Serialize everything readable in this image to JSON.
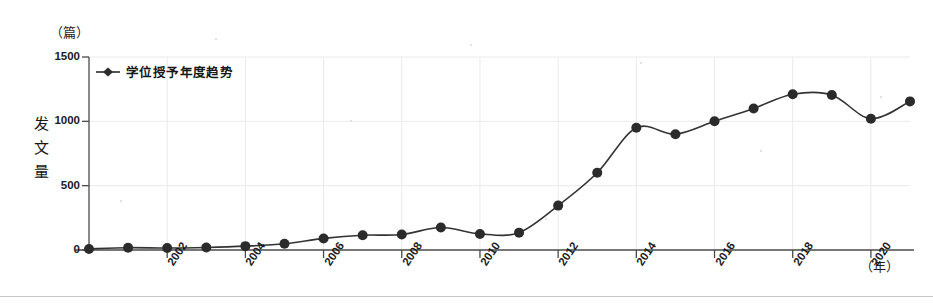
{
  "chart_data": {
    "type": "line",
    "title": "",
    "xlabel": "（年）",
    "ylabel": "发文量",
    "y_unit": "（篇）",
    "legend": [
      {
        "name": "学位授予年度趋势",
        "marker": "diamond"
      }
    ],
    "legend_position": "inside-top-left",
    "grid": true,
    "ylim": [
      0,
      1500
    ],
    "yticks": [
      0,
      500,
      1000,
      1500
    ],
    "ytick_labels": [
      "0",
      "500",
      "1000",
      "1500"
    ],
    "xlim": [
      2000,
      2021
    ],
    "xticks": [
      2002,
      2004,
      2006,
      2008,
      2010,
      2012,
      2014,
      2016,
      2018,
      2020
    ],
    "xtick_labels": [
      "2002",
      "2004",
      "2006",
      "2008",
      "2010",
      "2012",
      "2014",
      "2016",
      "2018",
      "2020"
    ],
    "x": [
      2000,
      2001,
      2002,
      2003,
      2004,
      2005,
      2006,
      2007,
      2008,
      2009,
      2010,
      2011,
      2012,
      2013,
      2014,
      2015,
      2016,
      2017,
      2018,
      2019,
      2020,
      2021
    ],
    "series": [
      {
        "name": "学位授予年度趋势",
        "values": [
          8,
          18,
          15,
          20,
          30,
          48,
          90,
          115,
          120,
          175,
          125,
          135,
          345,
          600,
          950,
          900,
          1000,
          1100,
          1210,
          1205,
          1020,
          1155
        ],
        "color": "#333333",
        "marker_color": "#2b2b2b",
        "line_width": 1.6,
        "marker_size": 5
      }
    ]
  },
  "axis": {
    "y_unit_label": "（篇）",
    "x_unit_label": "（年）",
    "y_title_chars": [
      "发",
      "文",
      "量"
    ]
  },
  "colors": {
    "line": "#333333",
    "marker": "#2b2b2b",
    "grid": "#eaeaea",
    "axis": "#4a4a4a",
    "background": "#ffffff"
  }
}
